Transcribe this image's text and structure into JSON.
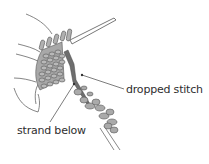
{
  "diagram": {
    "labels": {
      "dropped_stitch": "dropped stitch",
      "strand_below": "strand below"
    },
    "colors": {
      "background": "#ffffff",
      "outline": "#555555",
      "stitch_fill": "#a8a8a8",
      "needle_dark": "#6e6e6e",
      "label_text": "#2e2e2e"
    }
  }
}
